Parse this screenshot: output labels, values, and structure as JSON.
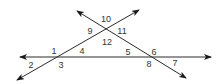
{
  "diagram": {
    "type": "geometry-angles",
    "colors": {
      "line": "#2a2a2a",
      "label": "#333333",
      "background": "#ffffff"
    },
    "lines": [
      {
        "id": "horizontal",
        "x1": 20,
        "y1": 57,
        "x2": 211,
        "y2": 57,
        "arrows": "both"
      },
      {
        "id": "rising",
        "x1": 17,
        "y1": 80,
        "x2": 139,
        "y2": 10,
        "arrows": "both"
      },
      {
        "id": "falling",
        "x1": 77,
        "y1": 11,
        "x2": 186,
        "y2": 78,
        "arrows": "both"
      }
    ],
    "intersections": [
      {
        "id": "left",
        "x": 58,
        "y": 57
      },
      {
        "id": "top",
        "x": 107,
        "y": 29
      },
      {
        "id": "right",
        "x": 153,
        "y": 57
      }
    ],
    "angles": [
      {
        "label": "1",
        "x": 54,
        "y": 51
      },
      {
        "label": "2",
        "x": 31,
        "y": 65
      },
      {
        "label": "3",
        "x": 61,
        "y": 65
      },
      {
        "label": "4",
        "x": 82,
        "y": 51
      },
      {
        "label": "5",
        "x": 128,
        "y": 52
      },
      {
        "label": "6",
        "x": 154,
        "y": 52
      },
      {
        "label": "7",
        "x": 175,
        "y": 63
      },
      {
        "label": "8",
        "x": 149,
        "y": 64
      },
      {
        "label": "9",
        "x": 90,
        "y": 31
      },
      {
        "label": "10",
        "x": 106,
        "y": 19
      },
      {
        "label": "11",
        "x": 122,
        "y": 31
      },
      {
        "label": "12",
        "x": 107,
        "y": 42
      }
    ]
  }
}
